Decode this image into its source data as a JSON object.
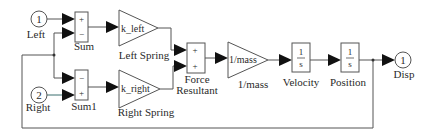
{
  "diagram": {
    "type": "simulink-block-diagram",
    "colors": {
      "wire": "#555555",
      "arrow": "#111111",
      "text": "#2a2a2a",
      "background": "#ffffff"
    },
    "blocks": {
      "inport_left": {
        "number": "1",
        "label": "Left"
      },
      "inport_right": {
        "number": "2",
        "label": "Right"
      },
      "sum": {
        "label": "Sum",
        "signs": [
          "+",
          "−"
        ]
      },
      "sum1": {
        "label": "Sum1",
        "signs": [
          "−",
          "+"
        ]
      },
      "left_spring": {
        "gain": "k_left",
        "label": "Left Spring"
      },
      "right_spring": {
        "gain": "k_right",
        "label": "Right Spring"
      },
      "force_resultant": {
        "label_line1": "Force",
        "label_line2": "Resultant",
        "signs": [
          "+",
          "+"
        ]
      },
      "mass_gain": {
        "gain": "1/mass",
        "label": "1/mass"
      },
      "velocity": {
        "numerator": "1",
        "denominator": "s",
        "label": "Velocity"
      },
      "position": {
        "numerator": "1",
        "denominator": "s",
        "label": "Position"
      },
      "outport_disp": {
        "number": "1",
        "label": "Disp"
      }
    }
  }
}
